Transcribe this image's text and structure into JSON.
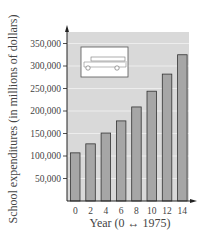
{
  "chart_data": {
    "type": "bar",
    "title": "",
    "xlabel": "Year (0 ↔ 1975)",
    "ylabel": "School expenditures (in millions of dollars)",
    "categories": [
      "0",
      "2",
      "4",
      "6",
      "8",
      "10",
      "12",
      "14"
    ],
    "values": [
      107000,
      127000,
      151000,
      178000,
      209000,
      244000,
      282000,
      325000
    ],
    "y_ticks": [
      "50,000",
      "100,000",
      "150,000",
      "200,000",
      "250,000",
      "300,000",
      "350,000"
    ],
    "y_tick_values": [
      50000,
      100000,
      150000,
      200000,
      250000,
      300000,
      350000
    ],
    "ylim": [
      0,
      375000
    ],
    "grid": true,
    "legend": null,
    "inset_icon": "school-bus-icon",
    "colors": {
      "plot_bg": "#d9d9d9",
      "bar": "#a6a6a6",
      "bar_edge": "#333333",
      "grid": "#f2f2f2"
    }
  }
}
